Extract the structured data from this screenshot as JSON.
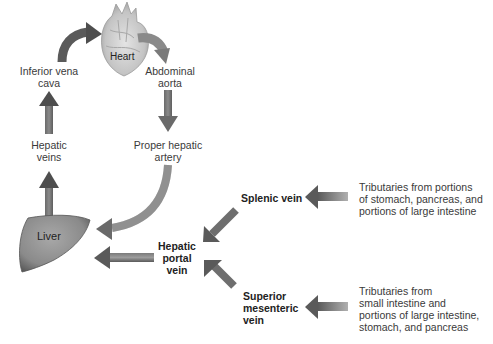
{
  "diagram": {
    "type": "flow",
    "nodes": {
      "heart": "Heart",
      "inferior_vena_cava": [
        "Inferior vena",
        "cava"
      ],
      "abdominal_aorta": [
        "Abdominal",
        "aorta"
      ],
      "hepatic_veins": [
        "Hepatic",
        "veins"
      ],
      "proper_hepatic_artery": [
        "Proper hepatic",
        "artery"
      ],
      "liver": "Liver",
      "hepatic_portal_vein": [
        "Hepatic",
        "portal",
        "vein"
      ],
      "splenic_vein": "Splenic vein",
      "superior_mesenteric_vein": [
        "Superior",
        "mesenteric",
        "vein"
      ],
      "splenic_tributaries": [
        "Tributaries from portions",
        "of stomach, pancreas, and",
        "portions of large intestine"
      ],
      "sm_tributaries": [
        "Tributaries from",
        "small intestine and",
        "portions of large intestine,",
        "stomach, and pancreas"
      ]
    },
    "edges": [
      {
        "from": "Inferior vena cava",
        "to": "Heart"
      },
      {
        "from": "Heart",
        "to": "Abdominal aorta"
      },
      {
        "from": "Abdominal aorta",
        "to": "Proper hepatic artery"
      },
      {
        "from": "Proper hepatic artery",
        "to": "Liver"
      },
      {
        "from": "Liver",
        "to": "Hepatic veins"
      },
      {
        "from": "Hepatic veins",
        "to": "Inferior vena cava"
      },
      {
        "from": "Hepatic portal vein",
        "to": "Liver"
      },
      {
        "from": "Splenic vein",
        "to": "Hepatic portal vein"
      },
      {
        "from": "Superior mesenteric vein",
        "to": "Hepatic portal vein"
      },
      {
        "from": "Splenic tributaries",
        "to": "Splenic vein"
      },
      {
        "from": "Small intestine tributaries",
        "to": "Superior mesenteric vein"
      }
    ],
    "colors": {
      "arrow_dark": "#5a5a5a",
      "arrow_light": "#9a9a9a",
      "liver": "#8c8c8c",
      "heart": "#c8c8c8"
    }
  }
}
